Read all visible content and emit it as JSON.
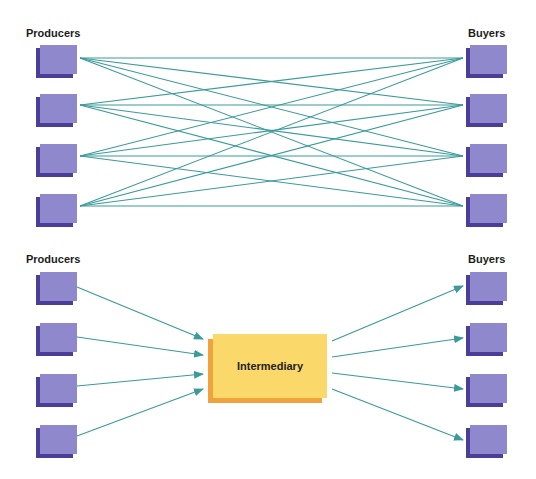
{
  "top_diagram": {
    "left_label": "Producers",
    "right_label": "Buyers",
    "producer_count": 4,
    "buyer_count": 4,
    "connection_type": "many-to-many direct links"
  },
  "bottom_diagram": {
    "left_label": "Producers",
    "right_label": "Buyers",
    "intermediary_label": "Intermediary",
    "producer_count": 4,
    "buyer_count": 4,
    "connection_type": "arrows via intermediary"
  },
  "colors": {
    "box_face": "#9088cc",
    "box_edge": "#4a3e98",
    "line": "#3b9a9a",
    "intermediary_face": "#fbd86a",
    "intermediary_edge": "#f0a23c"
  }
}
